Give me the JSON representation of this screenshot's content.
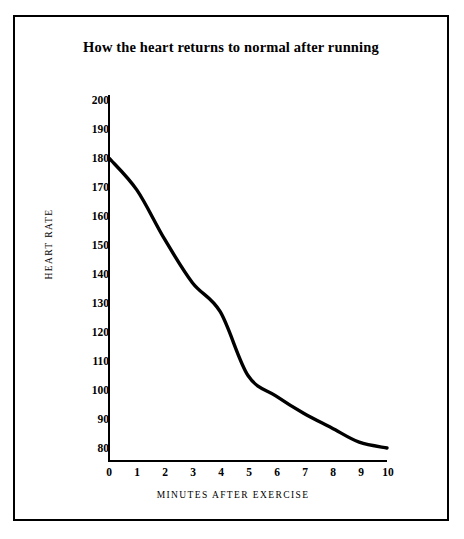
{
  "chart_data": {
    "type": "line",
    "title": "How the heart returns to normal after running",
    "xlabel": "MINUTES AFTER EXERCISE",
    "ylabel": "HEART RATE",
    "x": [
      0,
      1,
      2,
      3,
      4,
      5,
      6,
      7,
      8,
      9,
      10
    ],
    "values": [
      180,
      169,
      152,
      137,
      127,
      105,
      98,
      92,
      87,
      82,
      80
    ],
    "series": [
      {
        "name": "Heart rate recovery",
        "values": [
          180,
          169,
          152,
          137,
          127,
          105,
          98,
          92,
          87,
          82,
          80
        ]
      }
    ],
    "xlim": [
      0,
      10
    ],
    "ylim": [
      80,
      200
    ],
    "ytick_labels": [
      "200",
      "190",
      "180",
      "170",
      "160",
      "150",
      "140",
      "130",
      "120",
      "110",
      "100",
      "90",
      "80"
    ],
    "ytick_values": [
      200,
      190,
      180,
      170,
      160,
      150,
      140,
      130,
      120,
      110,
      100,
      90,
      80
    ],
    "xtick_labels": [
      "0",
      "1",
      "2",
      "3",
      "4",
      "5",
      "6",
      "7",
      "8",
      "9",
      "10"
    ],
    "xtick_values": [
      0,
      1,
      2,
      3,
      4,
      5,
      6,
      7,
      8,
      9,
      10
    ],
    "grid": false,
    "legend": "none",
    "line_color": "#000000",
    "axis_color": "#000000",
    "background_color": "#ffffff",
    "frame_border_color": "#000000"
  }
}
